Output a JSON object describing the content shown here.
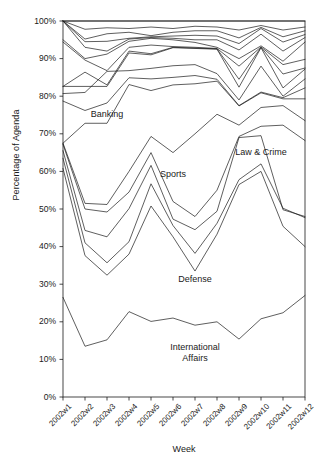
{
  "chart_data": {
    "type": "line",
    "title": "",
    "subtitle": "",
    "xlabel": "Week",
    "ylabel": "Percentage of Agenda",
    "categories": [
      "2002w1",
      "2002w2",
      "2002w3",
      "2002w4",
      "2002w5",
      "2002w6",
      "2002w7",
      "2002w8",
      "2002w9",
      "2002w10",
      "2002w11",
      "2002w12"
    ],
    "x_tick_labels": [
      "2002w1",
      "2002w2",
      "2002w3",
      "2002w4",
      "2002w5",
      "2002w6",
      "2002w7",
      "2002w8",
      "2002w9",
      "2002w10",
      "2002w11",
      "2002w12"
    ],
    "y_tick_labels": [
      "0%",
      "10%",
      "20%",
      "30%",
      "40%",
      "50%",
      "60%",
      "70%",
      "80%",
      "90%",
      "100%"
    ],
    "y_tick_values": [
      0,
      10,
      20,
      30,
      40,
      50,
      60,
      70,
      80,
      90,
      100
    ],
    "ylim": [
      0,
      100
    ],
    "xlim": [
      1,
      12
    ],
    "grid": false,
    "legend": "none",
    "note": "Cumulative stacked-percentage line chart; each line is a cumulative topic boundary. Inline text labels mark the named bands.",
    "annotations": [
      {
        "text": "Banking",
        "x_week": "2002w3",
        "y_percent": 75
      },
      {
        "text": "Sports",
        "x_week": "2002w6",
        "y_percent": 59
      },
      {
        "text": "Law & Crime",
        "x_week": "2002w10",
        "y_percent": 65
      },
      {
        "text": "Defense",
        "x_week": "2002w7",
        "y_percent": 31
      },
      {
        "text": "International Affairs",
        "x_week": "2002w7",
        "y_percent": 13
      }
    ],
    "series": [
      {
        "name": "International Affairs (cumulative)",
        "values": [
          26.5,
          13.5,
          15.2,
          22.7,
          20.1,
          21.0,
          19.1,
          20.0,
          15.4,
          20.8,
          22.4,
          27.0
        ]
      },
      {
        "name": "Defense (cumulative)",
        "values": [
          60.8,
          37.6,
          32.4,
          38.0,
          50.8,
          42.6,
          33.5,
          43.3,
          56.5,
          60.0,
          45.4,
          40.0
        ]
      },
      {
        "name": "Boundary 3 (cumulative)",
        "values": [
          63.5,
          41.0,
          35.7,
          41.3,
          56.7,
          45.6,
          38.2,
          46.2,
          57.8,
          62.0,
          50.2,
          47.7
        ]
      },
      {
        "name": "Sports (cumulative)",
        "values": [
          65.5,
          44.3,
          42.6,
          50.1,
          61.6,
          47.3,
          44.5,
          49.4,
          69.0,
          69.5,
          49.8,
          48.0
        ]
      },
      {
        "name": "Boundary 5 (cumulative)",
        "values": [
          67.2,
          50.0,
          49.2,
          54.5,
          65.0,
          52.0,
          48.0,
          55.0,
          69.3,
          72.0,
          72.3,
          68.2
        ]
      },
      {
        "name": "Law & Crime (cumulative)",
        "values": [
          67.5,
          51.5,
          51.2,
          60.0,
          69.3,
          65.0,
          70.0,
          75.2,
          72.3,
          77.0,
          77.5,
          73.5
        ]
      },
      {
        "name": "Banking (cumulative)",
        "values": [
          67.5,
          72.8,
          72.8,
          83.1,
          81.5,
          83.0,
          83.3,
          84.0,
          77.4,
          80.9,
          79.3,
          79.3
        ]
      },
      {
        "name": "Boundary 8 (cumulative)",
        "values": [
          78.7,
          76.2,
          78.2,
          84.9,
          84.6,
          85.0,
          85.5,
          84.5,
          77.5,
          81.1,
          79.6,
          82.2
        ]
      },
      {
        "name": "Boundary 9 (cumulative)",
        "values": [
          80.7,
          81.0,
          86.6,
          86.8,
          87.4,
          88.1,
          88.4,
          86.0,
          79.0,
          88.0,
          80.0,
          84.6
        ]
      },
      {
        "name": "Boundary 10 (cumulative)",
        "values": [
          82.6,
          82.6,
          82.6,
          91.5,
          91.0,
          92.9,
          92.7,
          92.5,
          82.4,
          92.9,
          82.2,
          87.2
        ]
      },
      {
        "name": "Boundary 11 (cumulative)",
        "values": [
          82.6,
          86.4,
          83.0,
          92.0,
          91.3,
          93.0,
          92.8,
          92.6,
          84.5,
          93.0,
          85.9,
          87.5
        ]
      },
      {
        "name": "Boundary 12 (cumulative)",
        "values": [
          94.4,
          89.6,
          86.8,
          93.0,
          93.6,
          93.2,
          93.0,
          92.7,
          88.0,
          93.1,
          88.4,
          89.8
        ]
      },
      {
        "name": "Boundary 13 (cumulative)",
        "values": [
          95.0,
          90.0,
          91.2,
          94.6,
          95.4,
          95.0,
          94.3,
          93.0,
          90.0,
          93.4,
          89.3,
          94.4
        ]
      },
      {
        "name": "Boundary 14 (cumulative)",
        "values": [
          100.0,
          93.0,
          92.0,
          95.2,
          95.6,
          95.4,
          95.0,
          95.0,
          92.3,
          96.5,
          92.0,
          95.6
        ]
      },
      {
        "name": "Boundary 15 (cumulative)",
        "values": [
          100.0,
          94.5,
          94.6,
          95.4,
          95.8,
          96.0,
          96.2,
          96.0,
          94.0,
          98.0,
          94.4,
          96.4
        ]
      },
      {
        "name": "Boundary 16 (cumulative)",
        "values": [
          100.0,
          95.2,
          96.6,
          97.0,
          96.1,
          97.0,
          97.4,
          97.4,
          95.5,
          98.3,
          95.8,
          97.4
        ]
      },
      {
        "name": "Boundary 17 (cumulative)",
        "values": [
          100.0,
          97.8,
          98.2,
          98.0,
          98.4,
          98.0,
          98.6,
          98.4,
          97.6,
          98.8,
          97.6,
          98.4
        ]
      },
      {
        "name": "Total (100%)",
        "values": [
          100.0,
          100.0,
          100.0,
          100.0,
          100.0,
          100.0,
          100.0,
          100.0,
          100.0,
          100.0,
          100.0,
          100.0
        ]
      }
    ]
  },
  "axes": {
    "y_title": "Percentage of Agenda",
    "x_title": "Week"
  }
}
